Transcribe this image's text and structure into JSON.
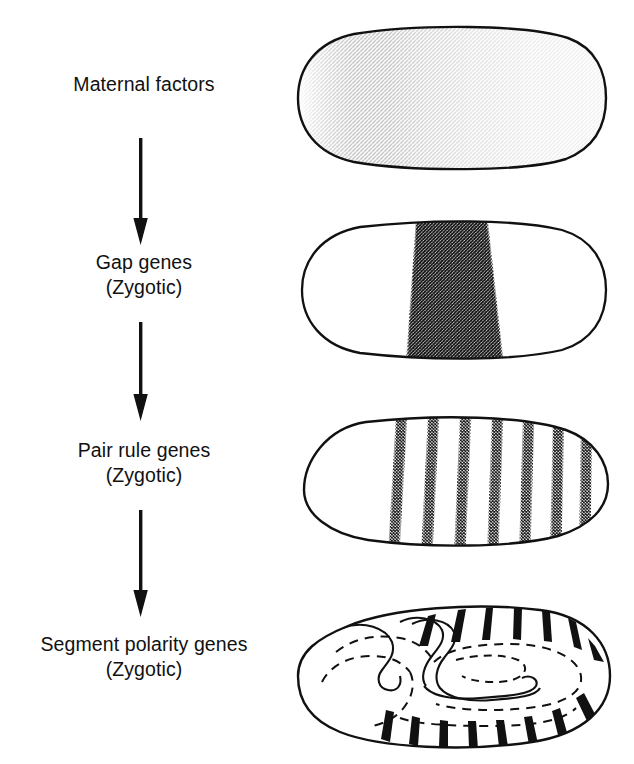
{
  "figure": {
    "background_color": "#ffffff",
    "ink_color": "#111111",
    "stipple_color": "#1a1a1a"
  },
  "stages": [
    {
      "id": "maternal",
      "label": "Maternal factors",
      "sublabel": "",
      "label_left": 34,
      "label_top": 72,
      "label_width": 220,
      "embryo": {
        "name": "embryo-maternal-gradient",
        "pattern": "anterior-posterior-gradient",
        "description": "Oval embryo with dense stipple at anterior pole fading to sparse stipple at posterior",
        "left": 296,
        "top": 22,
        "width": 312,
        "height": 152
      }
    },
    {
      "id": "gap",
      "label": "Gap genes",
      "sublabel": "(Zygotic)",
      "label_left": 44,
      "label_top": 250,
      "label_width": 200,
      "embryo": {
        "name": "embryo-gap-band",
        "pattern": "single-broad-band",
        "description": "Oval embryo with one broad central stippled band, wider at ventral edge",
        "left": 300,
        "top": 218,
        "width": 308,
        "height": 144
      }
    },
    {
      "id": "pair-rule",
      "label": "Pair rule genes",
      "sublabel": "(Zygotic)",
      "label_left": 34,
      "label_top": 438,
      "label_width": 220,
      "embryo": {
        "name": "embryo-pair-rule-stripes",
        "pattern": "seven-stripes",
        "stripe_count": 7,
        "description": "Oval embryo with seven stippled transverse stripes",
        "left": 300,
        "top": 414,
        "width": 310,
        "height": 140
      }
    },
    {
      "id": "segment-polarity",
      "label": "Segment polarity genes",
      "sublabel": "(Zygotic)",
      "label_left": 8,
      "label_top": 632,
      "label_width": 272,
      "embryo": {
        "name": "embryo-segment-polarity",
        "pattern": "germ-band-with-solid-stripes",
        "stripe_count": 15,
        "description": "Extended germ band embryo with solid black segmental stripes and dashed internal outlines",
        "left": 296,
        "top": 600,
        "width": 318,
        "height": 152
      }
    }
  ],
  "arrows": [
    {
      "name": "arrow-maternal-to-gap",
      "left": 128,
      "top": 138,
      "height": 108
    },
    {
      "name": "arrow-gap-to-pair-rule",
      "left": 128,
      "top": 322,
      "height": 100
    },
    {
      "name": "arrow-pair-rule-to-segment-polarity",
      "left": 128,
      "top": 510,
      "height": 108
    }
  ],
  "chart_data": {
    "type": "diagram",
    "flow": [
      "Maternal factors",
      "Gap genes (Zygotic)",
      "Pair rule genes (Zygotic)",
      "Segment polarity genes (Zygotic)"
    ],
    "expression_patterns": [
      {
        "stage": "Maternal factors",
        "pattern": "anterior-to-posterior gradient",
        "domains": 1
      },
      {
        "stage": "Gap genes",
        "pattern": "single broad central band",
        "domains": 1
      },
      {
        "stage": "Pair rule genes",
        "pattern": "seven transverse stripes",
        "domains": 7
      },
      {
        "stage": "Segment polarity genes",
        "pattern": "fourteen to fifteen narrow segmental stripes",
        "domains": 15
      }
    ]
  }
}
